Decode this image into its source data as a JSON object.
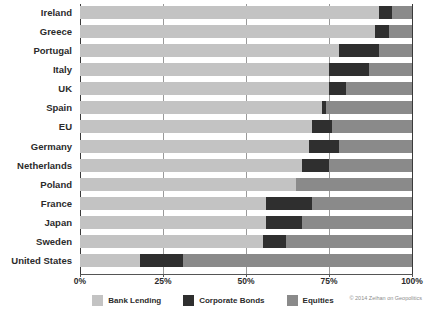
{
  "chart_data": {
    "type": "bar",
    "subtype": "stacked-horizontal-100percent",
    "title": "",
    "xlabel": "",
    "ylabel": "",
    "xlim": [
      0,
      100
    ],
    "grid": true,
    "gridlines": [
      0,
      25,
      50,
      75,
      100
    ],
    "xtick_labels": [
      "0%",
      "25%",
      "50%",
      "75%",
      "100%"
    ],
    "legend_position": "bottom-center",
    "categories": [
      "Ireland",
      "Greece",
      "Portugal",
      "Italy",
      "UK",
      "Spain",
      "EU",
      "Germany",
      "Netherlands",
      "Poland",
      "France",
      "Japan",
      "Sweden",
      "United States"
    ],
    "series": [
      {
        "name": "Bank Lending",
        "color": "#c3c3c3",
        "values": [
          90,
          89,
          78,
          75,
          75,
          73,
          70,
          69,
          67,
          65,
          56,
          56,
          55,
          18
        ]
      },
      {
        "name": "Corporate Bonds",
        "color": "#2f2f2f",
        "values": [
          4,
          4,
          12,
          12,
          5,
          1,
          6,
          9,
          8,
          0,
          14,
          11,
          7,
          13
        ]
      },
      {
        "name": "Equities",
        "color": "#8a8a8a",
        "values": [
          6,
          7,
          10,
          13,
          20,
          26,
          24,
          22,
          25,
          35,
          30,
          33,
          38,
          69
        ]
      }
    ]
  },
  "legend": {
    "items": [
      {
        "label": "Bank Lending",
        "color": "#c3c3c3"
      },
      {
        "label": "Corporate Bonds",
        "color": "#2f2f2f"
      },
      {
        "label": "Equities",
        "color": "#8a8a8a"
      }
    ]
  },
  "footer": {
    "copyright": "© 2014 Zeihan on Geopolitics"
  },
  "colors": {
    "bank_lending": "#c3c3c3",
    "corporate_bonds": "#2f2f2f",
    "equities": "#8a8a8a",
    "gridline": "#9a9a9a",
    "axis": "#3a3a3a",
    "text": "#2b2b2b"
  }
}
